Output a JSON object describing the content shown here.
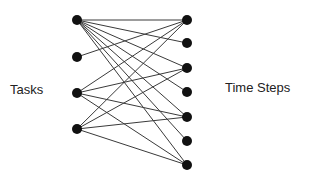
{
  "diagram": {
    "type": "bipartite-graph",
    "left_label": "Tasks",
    "right_label": "Time Steps",
    "colors": {
      "node": "#111111",
      "edge": "#3a3a3a",
      "text": "#222222",
      "background": "#ffffff"
    },
    "left_nodes": [
      {
        "id": "T1",
        "x": 77,
        "y": 20
      },
      {
        "id": "T2",
        "x": 77,
        "y": 57
      },
      {
        "id": "T3",
        "x": 77,
        "y": 93
      },
      {
        "id": "T4",
        "x": 77,
        "y": 129
      }
    ],
    "right_nodes": [
      {
        "id": "R1",
        "x": 187,
        "y": 20
      },
      {
        "id": "R2",
        "x": 187,
        "y": 43
      },
      {
        "id": "R3",
        "x": 187,
        "y": 68
      },
      {
        "id": "R4",
        "x": 187,
        "y": 92
      },
      {
        "id": "R5",
        "x": 187,
        "y": 117
      },
      {
        "id": "R6",
        "x": 187,
        "y": 141
      },
      {
        "id": "R7",
        "x": 187,
        "y": 165
      }
    ],
    "edges": [
      [
        "T1",
        "R1"
      ],
      [
        "T1",
        "R2"
      ],
      [
        "T1",
        "R3"
      ],
      [
        "T1",
        "R4"
      ],
      [
        "T1",
        "R5"
      ],
      [
        "T1",
        "R6"
      ],
      [
        "T1",
        "R7"
      ],
      [
        "T2",
        "R1"
      ],
      [
        "T3",
        "R1"
      ],
      [
        "T3",
        "R3"
      ],
      [
        "T3",
        "R5"
      ],
      [
        "T3",
        "R7"
      ],
      [
        "T4",
        "R1"
      ],
      [
        "T4",
        "R3"
      ],
      [
        "T4",
        "R5"
      ],
      [
        "T4",
        "R7"
      ]
    ],
    "node_radius": 5
  }
}
